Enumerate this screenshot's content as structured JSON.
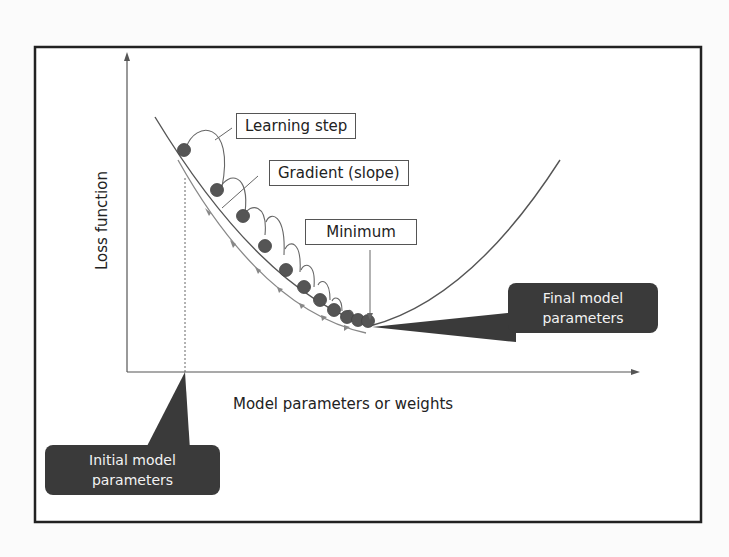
{
  "diagram": {
    "axes": {
      "x_label": "Model parameters or weights",
      "y_label": "Loss function"
    },
    "labels": {
      "learning_step": "Learning step",
      "gradient": "Gradient (slope)",
      "minimum": "Minimum"
    },
    "callouts": {
      "initial": "Initial model parameters",
      "initial_line1": "Initial model",
      "initial_line2": "parameters",
      "final": "Final model parameters",
      "final_line1": "Final model",
      "final_line2": "parameters"
    },
    "colors": {
      "curve": "#555555",
      "ball": "#555555",
      "callout_bg": "#3a3a3a",
      "frame": "#222222"
    }
  }
}
